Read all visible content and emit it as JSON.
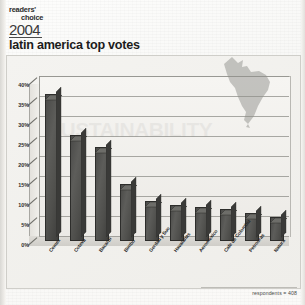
{
  "logo": {
    "line1": "readers'",
    "line2": "choice",
    "year": "2004"
  },
  "page_title": "latin america top votes",
  "footer": {
    "respondents_note": "respondents = 408"
  },
  "watermark": {
    "text": "SUSTAINABILITY"
  },
  "decor": {
    "map_name": "latin-america-map",
    "map_color": "#9a9a96"
  },
  "colors": {
    "bar_fill": "#4f4f4c",
    "bar_outline": "#2d2d2b",
    "grid": "#8d8d88",
    "paper": "#f4f3f0",
    "text": "#1c1c1c"
  },
  "chart_data": {
    "type": "bar",
    "title": "latin america top votes",
    "subtitle": "",
    "xlabel": "",
    "ylabel": "",
    "ylim": [
      0,
      40
    ],
    "ytick_labels": [
      "40%",
      "35%",
      "30%",
      "25%",
      "20%",
      "15%",
      "10%",
      "5%",
      "0%"
    ],
    "ytick_values": [
      40,
      35,
      30,
      25,
      20,
      15,
      10,
      5,
      0
    ],
    "grid": true,
    "legend": "none",
    "categories": [
      "Cemex",
      "Coteva",
      "Bacardi",
      "Bimbo",
      "Gerdau y Suo",
      "Havaianas",
      "Aeromexico",
      "Cafe de Colombia",
      "Petrobras",
      "Natura"
    ],
    "values": [
      36.2,
      26.0,
      23.0,
      13.8,
      9.6,
      8.6,
      8.0,
      7.6,
      6.6,
      5.6
    ],
    "value_labels": [
      "36%",
      "26%",
      "23%",
      "14%",
      "10%",
      "9%",
      "8%",
      "8%",
      "7%",
      "6%"
    ],
    "respondents": 408
  }
}
